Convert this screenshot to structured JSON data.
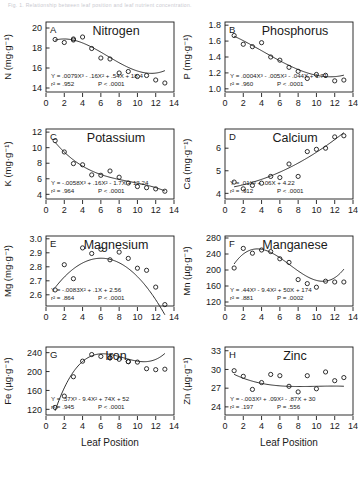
{
  "header": {
    "caption": "Fig. 1. Relationship between leaf position and leaf nutrient concentration."
  },
  "axis": {
    "xlabel": "Leaf Position",
    "xticks": [
      0,
      2,
      4,
      6,
      8,
      10,
      12,
      14
    ],
    "xlim": [
      0,
      14
    ]
  },
  "chart_data": [
    {
      "type": "scatter",
      "panel": "A",
      "title": "Nitrogen",
      "ylabel": "N (mg·g⁻¹)",
      "xlabel": "Leaf Position",
      "yticks": [
        14,
        16,
        18,
        20
      ],
      "ylim": [
        13.6,
        20.6
      ],
      "xlim": [
        0,
        14
      ],
      "x": [
        1,
        2,
        3,
        3,
        4,
        5,
        6,
        7,
        8,
        9,
        10,
        11,
        12,
        13
      ],
      "values": [
        18.85,
        18.55,
        18.8,
        18.9,
        19.1,
        17.95,
        17.0,
        16.9,
        15.5,
        15.65,
        15.15,
        15.25,
        14.8,
        14.5
      ],
      "equation": "Y = .0079X³ - .16X² + .54X + 18.4",
      "r2": "r² = .952",
      "p": "P < .0001",
      "fit_coeffs": [
        18.4,
        0.54,
        -0.16,
        0.0079
      ]
    },
    {
      "type": "scatter",
      "panel": "B",
      "title": "Phosphorus",
      "ylabel": "P (mg·g⁻¹)",
      "xlabel": "Leaf Position",
      "yticks": [
        1.0,
        1.2,
        1.4,
        1.6,
        1.8
      ],
      "ylim": [
        0.96,
        1.84
      ],
      "xlim": [
        0,
        14
      ],
      "x": [
        1,
        2,
        3,
        4,
        5,
        6,
        7,
        8,
        9,
        10,
        11,
        12,
        13
      ],
      "values": [
        1.67,
        1.56,
        1.53,
        1.58,
        1.4,
        1.36,
        1.27,
        1.22,
        1.13,
        1.18,
        1.17,
        1.1,
        1.11
      ],
      "equation": "Y = .0004X³ - .005X² - .044X + 1.71",
      "r2": "r² = .960",
      "p": "P < .0001",
      "fit_coeffs": [
        1.71,
        -0.044,
        -0.005,
        0.0004
      ]
    },
    {
      "type": "scatter",
      "panel": "C",
      "title": "Potassium",
      "ylabel": "K (mg·g⁻¹)",
      "xlabel": "Leaf Position",
      "yticks": [
        4,
        6,
        8,
        10,
        12
      ],
      "ylim": [
        3.4,
        12.4
      ],
      "xlim": [
        0,
        14
      ],
      "x": [
        1,
        2,
        3,
        4,
        5,
        6,
        7,
        8,
        9,
        10,
        11,
        12,
        13
      ],
      "values": [
        10.9,
        9.45,
        7.95,
        7.8,
        6.5,
        6.45,
        7.0,
        6.2,
        5.45,
        5.0,
        4.85,
        4.7,
        4.4
      ],
      "equation": "Y = -.0058X³ + .16X² - 1.7X + 12.24",
      "r2": "r² = .964",
      "p": "P < .0001",
      "fit_coeffs": [
        12.24,
        -1.7,
        0.16,
        -0.0058
      ]
    },
    {
      "type": "scatter",
      "panel": "D",
      "title": "Calcium",
      "ylabel": "Ca (mg·g⁻¹)",
      "xlabel": "Leaf Position",
      "yticks": [
        4,
        5,
        6
      ],
      "ylim": [
        3.75,
        6.85
      ],
      "xlim": [
        0,
        14
      ],
      "x": [
        1,
        2,
        3,
        4,
        5,
        6,
        7,
        8,
        9,
        10,
        11,
        12,
        13
      ],
      "values": [
        4.5,
        4.2,
        4.35,
        4.45,
        4.75,
        4.7,
        5.3,
        4.75,
        5.85,
        5.95,
        6.0,
        6.5,
        6.55
      ],
      "equation": "Y = .01X² +  .06X + 4.22",
      "r2": "r² = .912",
      "p": "P < .0001",
      "fit_coeffs": [
        4.22,
        0.06,
        0.01,
        0
      ]
    },
    {
      "type": "scatter",
      "panel": "E",
      "title": "Magnesium",
      "ylabel": "Mg (mg·g⁻¹)",
      "xlabel": "Leaf Position",
      "yticks": [
        2.6,
        2.7,
        2.8,
        2.9,
        3.0
      ],
      "ylim": [
        2.52,
        3.02
      ],
      "xlim": [
        0,
        14
      ],
      "x": [
        1,
        2,
        3,
        4,
        5,
        6,
        7,
        8,
        9,
        10,
        11,
        12,
        13
      ],
      "values": [
        2.635,
        2.815,
        2.715,
        2.935,
        2.895,
        2.925,
        2.85,
        2.905,
        2.86,
        2.79,
        2.775,
        2.655,
        2.53
      ],
      "equation": "Y =  -.0083X² + .1X + 2.56",
      "r2": "r² = .864",
      "p": "P < .0001",
      "fit_coeffs": [
        2.56,
        0.1,
        -0.0083,
        0
      ]
    },
    {
      "type": "scatter",
      "panel": "F",
      "title": "Manganese",
      "ylabel": "Mn (µg·g⁻¹)",
      "xlabel": "Leaf Position",
      "yticks": [
        120,
        160,
        200,
        240,
        280
      ],
      "ylim": [
        110,
        285
      ],
      "xlim": [
        0,
        14
      ],
      "x": [
        1,
        2,
        3,
        4,
        5,
        6,
        7,
        8,
        9,
        10,
        11,
        12,
        13
      ],
      "values": [
        205,
        254,
        242,
        250,
        246,
        228,
        219,
        176,
        166,
        157,
        172,
        170,
        170
      ],
      "equation": "Y = .44X³ - 9.4X² +  50X + 174",
      "r2": "r² = .881",
      "p": "P = .0002",
      "fit_coeffs": [
        174,
        50,
        -9.4,
        0.44
      ]
    },
    {
      "type": "scatter",
      "panel": "G",
      "title": "Iron",
      "ylabel": "Fe (µg·g⁻¹)",
      "xlabel": "Leaf Position",
      "yticks": [
        120,
        160,
        200,
        240
      ],
      "ylim": [
        108,
        252
      ],
      "xlim": [
        0,
        14
      ],
      "x": [
        1,
        2,
        3,
        4,
        5,
        6,
        7,
        7,
        8,
        9,
        9,
        10,
        11,
        12,
        13
      ],
      "values": [
        124,
        148,
        189,
        222,
        236,
        232,
        229,
        229,
        226,
        221,
        221,
        220,
        206,
        204,
        205
      ],
      "equation": "Y = .37X³ - 9.4X² + 74X + 52",
      "r2": "r² = .945",
      "p": "P < .0001",
      "fit_coeffs": [
        52,
        74,
        -9.4,
        0.37
      ]
    },
    {
      "type": "scatter",
      "panel": "H",
      "title": "Zinc",
      "ylabel": "Zn (µg·g⁻¹)",
      "xlabel": "Leaf Position",
      "yticks": [
        24,
        27,
        30,
        33
      ],
      "ylim": [
        22.7,
        33.6
      ],
      "xlim": [
        0,
        14
      ],
      "x": [
        1,
        2,
        3,
        4,
        5,
        6,
        7,
        8,
        9,
        10,
        11,
        12,
        13
      ],
      "values": [
        29.8,
        28.9,
        26.8,
        27.9,
        29.2,
        29.0,
        27.3,
        26.4,
        29.0,
        26.9,
        29.6,
        28.2,
        28.7
      ],
      "equation": "Y = -.003X³ + .09X² - .87X + 30",
      "r2": "r² = .197",
      "p": "P = .556",
      "fit_coeffs": [
        30,
        -0.87,
        0.09,
        -0.003
      ]
    }
  ]
}
